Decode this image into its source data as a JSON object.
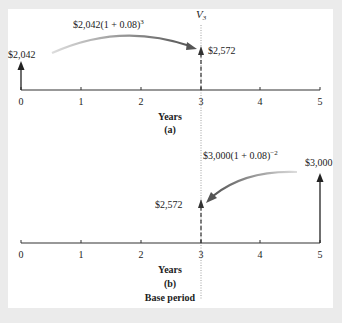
{
  "figure": {
    "part_a": {
      "axis_ticks": [
        "0",
        "1",
        "2",
        "3",
        "4",
        "5"
      ],
      "axis_label": "Years",
      "caption": "(a)",
      "start_value": "$2,042",
      "end_value": "$2,572",
      "formula_base": "$2,042(1 + 0.08)",
      "formula_exp": "3",
      "marker_label_var": "V",
      "marker_label_sub": "3"
    },
    "part_b": {
      "axis_ticks": [
        "0",
        "1",
        "2",
        "3",
        "4",
        "5"
      ],
      "axis_label": "Years",
      "caption": "(b)",
      "base_period_label": "Base period",
      "start_value": "$3,000",
      "end_value": "$2,572",
      "formula_base": "$3,000(1 + 0.08)",
      "formula_exp": "−2"
    },
    "colors": {
      "panel_bg": "#ffffff",
      "outer_bg": "#ebebeb",
      "axis": "#333333",
      "curve_arrow": "#6e6e6e"
    }
  }
}
